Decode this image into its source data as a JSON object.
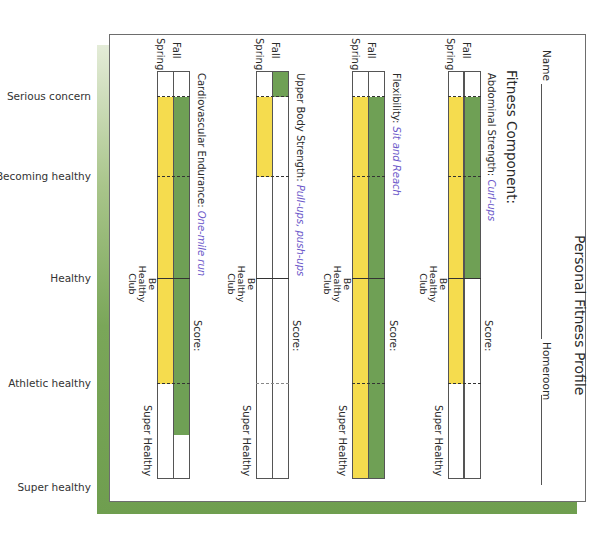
{
  "levels": [
    {
      "label": "Serious concern",
      "y": 96
    },
    {
      "label": "Becoming healthy",
      "y": 176
    },
    {
      "label": "Healthy",
      "y": 278
    },
    {
      "label": "Athletic healthy",
      "y": 383
    },
    {
      "label": "Super healthy",
      "y": 487
    }
  ],
  "form": {
    "title": "Personal Fitness Profile",
    "name_label": "Name",
    "homeroom_label": "Homeroom",
    "fitness_component_label": "Fitness Component:",
    "season_labels": {
      "fall": "Fall",
      "spring": "Spring"
    },
    "club_labels": {
      "be_healthy": "Be Healthy Club",
      "super_healthy": "Super Healthy"
    },
    "score_label": "Score:"
  },
  "components": [
    {
      "name": "Abdominal Strength:",
      "test": "Curl-ups",
      "spring_fill": [
        96,
        383
      ],
      "fall_fill": [
        96,
        278
      ]
    },
    {
      "name": "Flexibility:",
      "test": "Sit and Reach",
      "spring_fill": [
        96,
        479
      ],
      "fall_fill": [
        96,
        479
      ]
    },
    {
      "name": "Upper Body Strength:",
      "test": "Pull-ups, push-ups",
      "spring_fill": [
        96,
        176
      ],
      "fall_fill": [
        71,
        96
      ]
    },
    {
      "name": "Cardiovascular Endurance:",
      "test": "One-mile run",
      "spring_fill": [
        96,
        383
      ],
      "fall_fill": [
        96,
        434
      ]
    }
  ],
  "colors": {
    "spring": "#f5dc4e",
    "fall": "#6fa055",
    "green_frame": "#6f9e4f",
    "test_text": "#6b57c9"
  }
}
